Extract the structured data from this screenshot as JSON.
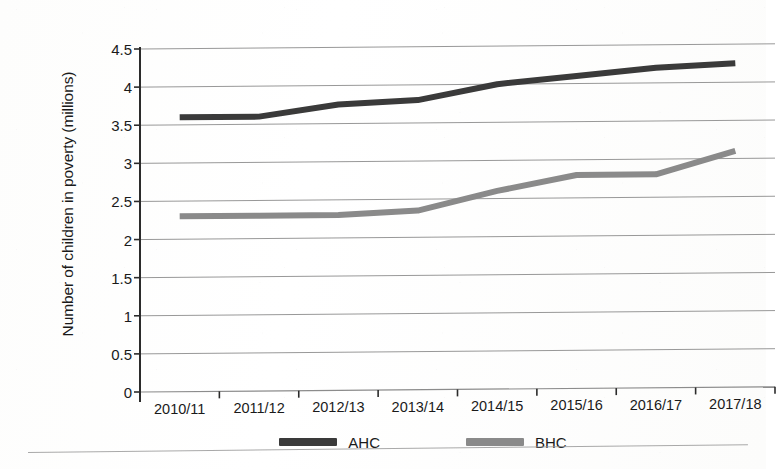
{
  "chart_data": {
    "type": "line",
    "title": "",
    "xlabel": "",
    "ylabel": "Number of children in poverty (millions)",
    "categories": [
      "2010/11",
      "2011/12",
      "2012/13",
      "2013/14",
      "2014/15",
      "2015/16",
      "2016/17",
      "2017/18"
    ],
    "series": [
      {
        "name": "AHC",
        "color": "#3a3a3a",
        "values": [
          3.6,
          3.6,
          3.75,
          3.8,
          4.0,
          4.1,
          4.2,
          4.25
        ]
      },
      {
        "name": "BHC",
        "color": "#8a8a8a",
        "values": [
          2.3,
          2.3,
          2.3,
          2.35,
          2.6,
          2.8,
          2.8,
          3.1
        ]
      }
    ],
    "ylim": [
      0,
      4.5
    ],
    "y_ticks": [
      0,
      0.5,
      1,
      1.5,
      2,
      2.5,
      3,
      3.5,
      4,
      4.5
    ],
    "y_tick_labels": [
      "0",
      "0.5",
      "1",
      "1.5",
      "2",
      "2.5",
      "3",
      "3.5",
      "4",
      "4.5"
    ],
    "grid": true,
    "grid_axis": "y",
    "grid_color": "#8c8c8c",
    "legend_position": "bottom",
    "axis_color": "#2b2b2b"
  }
}
